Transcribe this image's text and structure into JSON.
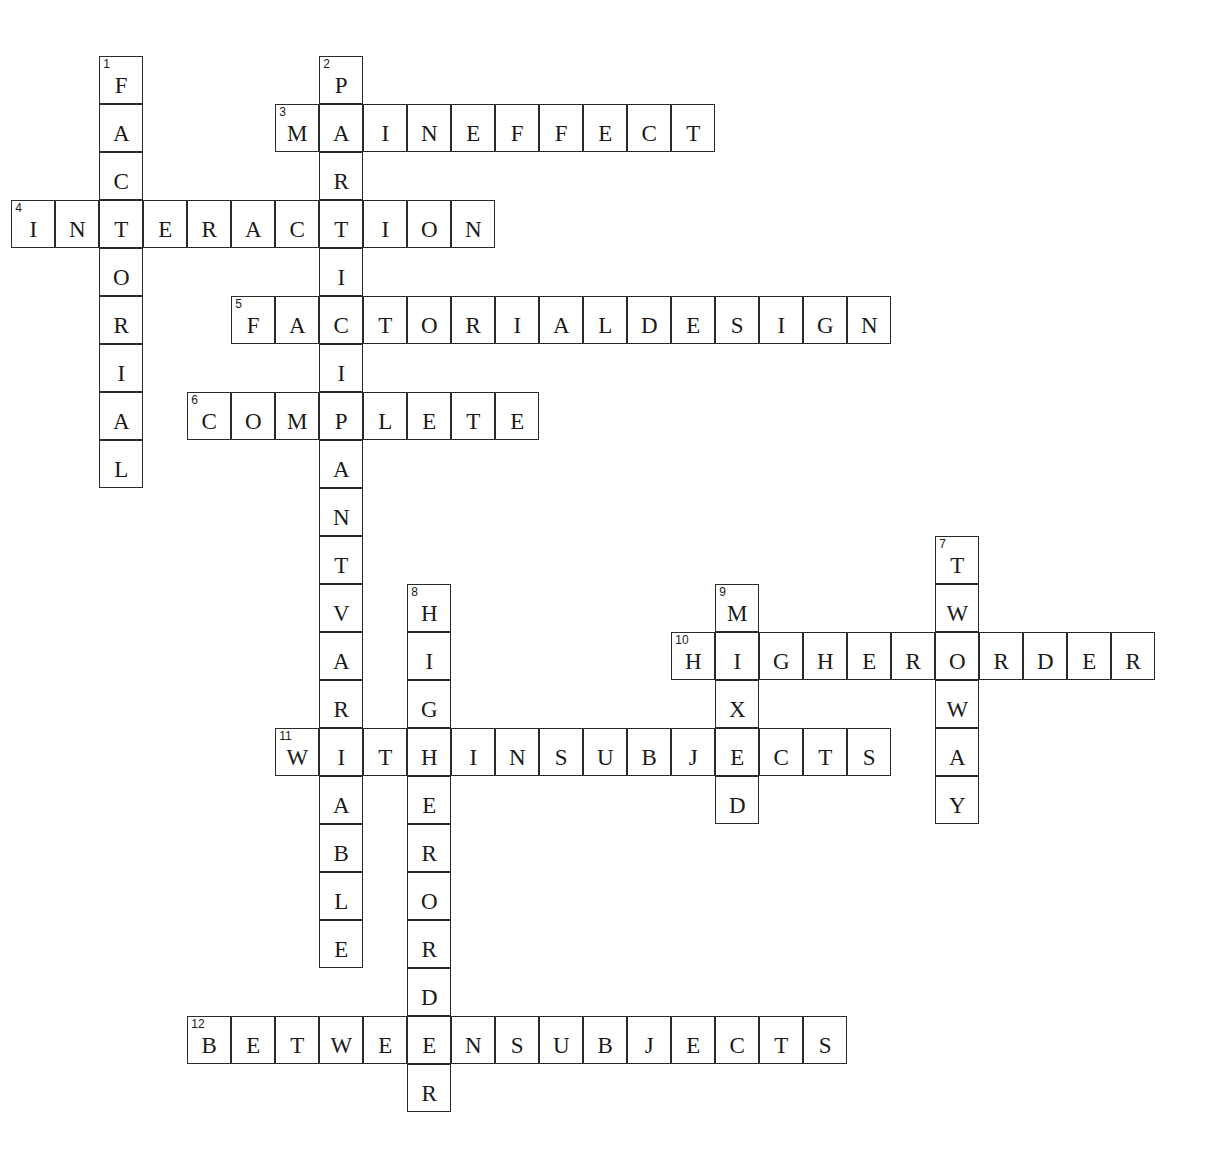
{
  "puzzle": {
    "grid": {
      "origin_x": 12,
      "origin_y": 57,
      "cell_w": 44,
      "cell_h": 48
    },
    "entries": [
      {
        "number": 1,
        "direction": "down",
        "row": 0,
        "col": 2,
        "answer": "FACTORIAL"
      },
      {
        "number": 2,
        "direction": "down",
        "row": 0,
        "col": 7,
        "answer": "PARTICIPANTVARIABLE"
      },
      {
        "number": 3,
        "direction": "across",
        "row": 1,
        "col": 6,
        "answer": "MAINEFFECT"
      },
      {
        "number": 4,
        "direction": "across",
        "row": 3,
        "col": 0,
        "answer": "INTERACTION"
      },
      {
        "number": 5,
        "direction": "across",
        "row": 5,
        "col": 5,
        "answer": "FACTORIALDESIGN"
      },
      {
        "number": 6,
        "direction": "across",
        "row": 7,
        "col": 4,
        "answer": "COMPLETE"
      },
      {
        "number": 7,
        "direction": "down",
        "row": 10,
        "col": 21,
        "answer": "TWOWAY"
      },
      {
        "number": 8,
        "direction": "down",
        "row": 11,
        "col": 9,
        "answer": "HIGHERORDER"
      },
      {
        "number": 9,
        "direction": "down",
        "row": 11,
        "col": 16,
        "answer": "MIXED"
      },
      {
        "number": 10,
        "direction": "across",
        "row": 12,
        "col": 15,
        "answer": "HIGHERORDER"
      },
      {
        "number": 11,
        "direction": "across",
        "row": 14,
        "col": 6,
        "answer": "WITHINSUBJECTS"
      },
      {
        "number": 12,
        "direction": "across",
        "row": 20,
        "col": 4,
        "answer": "BETWEENSUBJECTS"
      }
    ]
  }
}
